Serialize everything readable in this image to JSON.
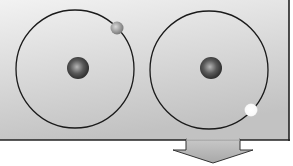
{
  "diagram": {
    "panel": {
      "background_top": "#f0f0f0",
      "background_bottom": "#c4c4c4",
      "border": "#222222"
    },
    "atoms": [
      {
        "name": "atom-left",
        "orbit_cx": 75,
        "orbit_cy": 69,
        "orbit_r": 59,
        "nucleus_color": "#555555",
        "electron_color": "#a0a0a0",
        "electron_cx": 117,
        "electron_cy": 28,
        "electron_state": "grey"
      },
      {
        "name": "atom-right",
        "orbit_cx": 210,
        "orbit_cy": 69,
        "orbit_r": 59,
        "nucleus_color": "#555555",
        "electron_color": "#ffffff",
        "electron_cx": 251,
        "electron_cy": 110,
        "electron_state": "white"
      }
    ],
    "arrow": {
      "direction": "down",
      "color": "#bcbcbc"
    }
  }
}
